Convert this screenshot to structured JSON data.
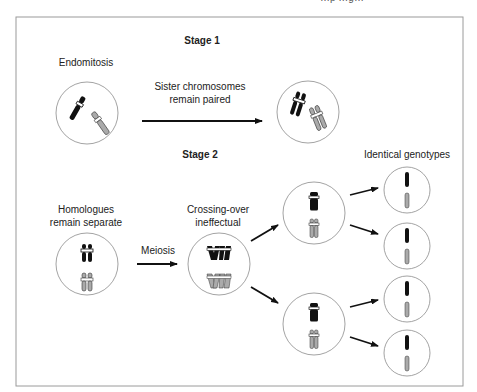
{
  "header": {
    "clipped_text": "…p …g…"
  },
  "stage1": {
    "title": "Stage 1",
    "left_label": "Endomitosis",
    "arrow_label_line1": "Sister chromosomes",
    "arrow_label_line2": "remain paired"
  },
  "stage2": {
    "title": "Stage 2",
    "left_label_line1": "Homologues",
    "left_label_line2": "remain separate",
    "arrow_label": "Meiosis",
    "middle_label_line1": "Crossing-over",
    "middle_label_line2": "ineffectual",
    "right_label": "Identical genotypes"
  },
  "colors": {
    "frame": "#9a9a9a",
    "circle": "#8c8c8c",
    "chromosome_dark": "#111111",
    "chromosome_light": "#a9a9a9",
    "arrow": "#111111"
  }
}
